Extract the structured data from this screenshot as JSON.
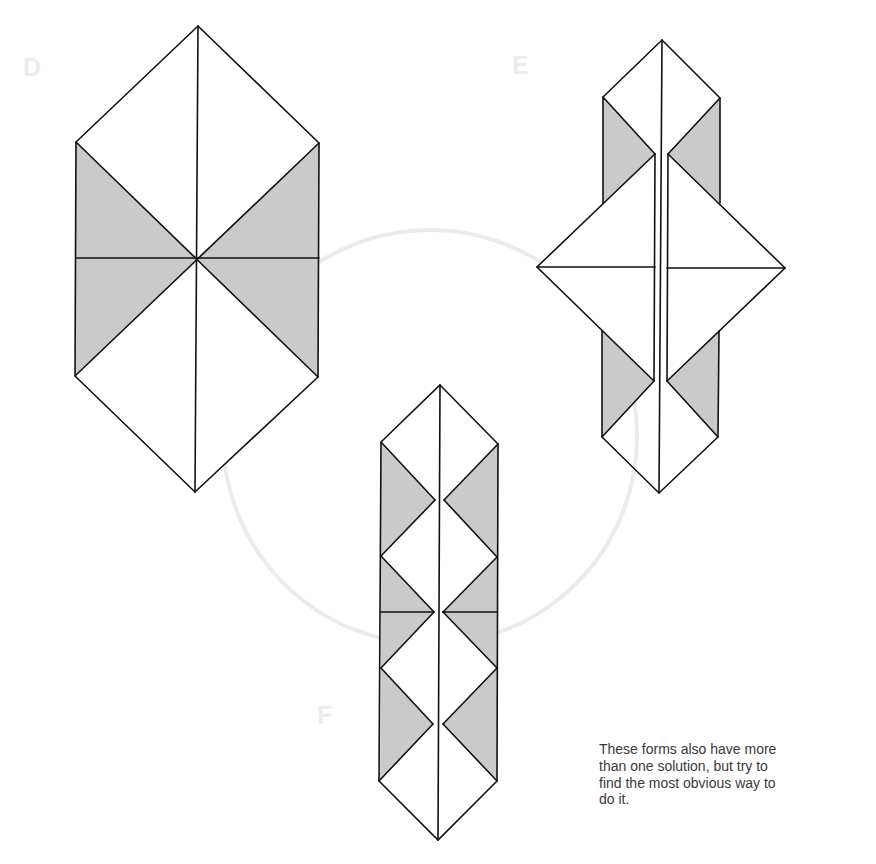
{
  "colors": {
    "background": "#ffffff",
    "stroke": "#111111",
    "shade": "#cacaca",
    "circle": "#ebebeb",
    "label": "#ececec",
    "caption": "#3a3a3a"
  },
  "labels": {
    "d": "D",
    "e": "E",
    "f": "F"
  },
  "caption": {
    "lines": [
      "These forms also have more",
      "than one solution, but try to",
      "find the most obvious way to",
      "do it."
    ]
  },
  "background_circle": {
    "cx": 430,
    "cy": 437,
    "r": 207,
    "stroke_width": 4
  },
  "shapes": {
    "d": {
      "name": "D",
      "shaded_triangles": [
        [
          [
            76,
            142
          ],
          [
            197,
            258
          ],
          [
            76,
            258
          ]
        ],
        [
          [
            76,
            258
          ],
          [
            197,
            258
          ],
          [
            75,
            376
          ]
        ],
        [
          [
            319,
            143
          ],
          [
            197,
            258
          ],
          [
            319,
            258
          ]
        ],
        [
          [
            319,
            258
          ],
          [
            197,
            258
          ],
          [
            318,
            377
          ]
        ]
      ],
      "outline": [
        [
          198,
          26
        ],
        [
          319,
          143
        ],
        [
          318,
          377
        ],
        [
          195,
          492
        ],
        [
          75,
          376
        ],
        [
          76,
          142
        ]
      ],
      "lines": [
        [
          [
            198,
            26
          ],
          [
            195,
            492
          ]
        ],
        [
          [
            76,
            258
          ],
          [
            319,
            258
          ]
        ],
        [
          [
            76,
            142
          ],
          [
            318,
            377
          ]
        ],
        [
          [
            319,
            143
          ],
          [
            75,
            376
          ]
        ]
      ]
    },
    "e": {
      "name": "E",
      "shaded_triangles": [
        [
          [
            603,
            97
          ],
          [
            655,
            154
          ],
          [
            603,
            203
          ]
        ],
        [
          [
            720,
            98
          ],
          [
            668,
            154
          ],
          [
            720,
            203
          ]
        ],
        [
          [
            602,
            331
          ],
          [
            654,
            381
          ],
          [
            602,
            437
          ]
        ],
        [
          [
            719,
            331
          ],
          [
            667,
            381
          ],
          [
            718,
            437
          ]
        ]
      ],
      "outline_top": [
        [
          603,
          203
        ],
        [
          603,
          97
        ],
        [
          662,
          40
        ],
        [
          720,
          98
        ],
        [
          720,
          203
        ]
      ],
      "outline_bottom": [
        [
          602,
          331
        ],
        [
          602,
          437
        ],
        [
          659,
          493
        ],
        [
          718,
          437
        ],
        [
          719,
          331
        ]
      ],
      "big_diamond": [
        [
          655,
          154
        ],
        [
          537,
          267
        ],
        [
          654,
          381
        ]
      ],
      "big_diamond_right": [
        [
          668,
          154
        ],
        [
          785,
          268
        ],
        [
          667,
          381
        ]
      ],
      "lines": [
        [
          [
            662,
            40
          ],
          [
            659,
            493
          ]
        ],
        [
          [
            655,
            154
          ],
          [
            654,
            381
          ]
        ],
        [
          [
            668,
            154
          ],
          [
            667,
            381
          ]
        ],
        [
          [
            537,
            267
          ],
          [
            655,
            267
          ]
        ],
        [
          [
            667,
            268
          ],
          [
            785,
            268
          ]
        ],
        [
          [
            603,
            97
          ],
          [
            655,
            154
          ]
        ],
        [
          [
            720,
            98
          ],
          [
            668,
            154
          ]
        ],
        [
          [
            602,
            437
          ],
          [
            654,
            381
          ]
        ],
        [
          [
            718,
            437
          ],
          [
            667,
            381
          ]
        ]
      ]
    },
    "f": {
      "name": "F",
      "shaded_triangles": [
        [
          [
            381,
            442
          ],
          [
            435,
            500
          ],
          [
            381,
            556
          ]
        ],
        [
          [
            498,
            444
          ],
          [
            444,
            500
          ],
          [
            497,
            557
          ]
        ],
        [
          [
            381,
            556
          ],
          [
            434,
            612
          ],
          [
            381,
            668
          ]
        ],
        [
          [
            497,
            557
          ],
          [
            443,
            612
          ],
          [
            497,
            668
          ]
        ],
        [
          [
            381,
            668
          ],
          [
            433,
            724
          ],
          [
            380,
            781
          ]
        ],
        [
          [
            497,
            668
          ],
          [
            443,
            724
          ],
          [
            497,
            781
          ]
        ]
      ],
      "outline": [
        [
          440,
          385
        ],
        [
          498,
          444
        ],
        [
          497,
          781
        ],
        [
          438,
          840
        ],
        [
          379,
          781
        ],
        [
          381,
          442
        ]
      ],
      "lines": [
        [
          [
            440,
            385
          ],
          [
            438,
            840
          ]
        ],
        [
          [
            381,
            442
          ],
          [
            435,
            500
          ]
        ],
        [
          [
            435,
            500
          ],
          [
            381,
            556
          ]
        ],
        [
          [
            381,
            556
          ],
          [
            434,
            612
          ]
        ],
        [
          [
            434,
            612
          ],
          [
            381,
            668
          ]
        ],
        [
          [
            381,
            668
          ],
          [
            433,
            724
          ]
        ],
        [
          [
            433,
            724
          ],
          [
            379,
            781
          ]
        ],
        [
          [
            498,
            444
          ],
          [
            444,
            500
          ]
        ],
        [
          [
            444,
            500
          ],
          [
            497,
            557
          ]
        ],
        [
          [
            497,
            557
          ],
          [
            443,
            612
          ]
        ],
        [
          [
            443,
            612
          ],
          [
            497,
            668
          ]
        ],
        [
          [
            497,
            668
          ],
          [
            443,
            724
          ]
        ],
        [
          [
            443,
            724
          ],
          [
            497,
            781
          ]
        ],
        [
          [
            381,
            612
          ],
          [
            434,
            612
          ]
        ],
        [
          [
            443,
            612
          ],
          [
            497,
            612
          ]
        ]
      ]
    }
  }
}
